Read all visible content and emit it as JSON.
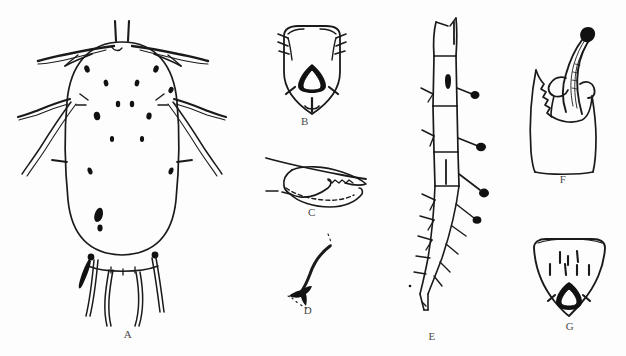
{
  "figure": {
    "background_color": "#fdfdfd",
    "ink_color": "#1a1a1a",
    "label_color": "#4a4a4a",
    "width": 626,
    "height": 356,
    "type": "scientific-taxonomic-line-plate"
  },
  "panels": [
    {
      "id": "A",
      "label": "A",
      "name": "whole-body-dorsal-habitus",
      "description": "Dorsal habitus of apterous aphid with oval body, paired head setae, long lateral marginal setae, dark dorsal sclerites and four long caudal setae",
      "label_x": 118,
      "label_y": 336
    },
    {
      "id": "B",
      "label": "B",
      "name": "anal-plate-and-genital-plate",
      "description": "Posterior abdominal plate bearing marginal setae and a dark median sclerite enclosing a pale teardrop",
      "label_x": 305,
      "label_y": 118
    },
    {
      "id": "C",
      "label": "C",
      "name": "mandible-stylet-structure",
      "description": "Angular mouthpart sclerite with serrate margin and dashed outline",
      "label_x": 311,
      "label_y": 215
    },
    {
      "id": "D",
      "label": "D",
      "name": "dorsal-seta-with-basal-socket",
      "description": "Single sinuate seta arising from a flared basal socket, dotted body outline",
      "label_x": 308,
      "label_y": 310
    },
    {
      "id": "E",
      "label": "E",
      "name": "antenna-segmented",
      "description": "Multi-segmented antenna with clavate setae on segments III to V and a slender terminal process",
      "label_x": 423,
      "label_y": 328
    },
    {
      "id": "F",
      "label": "F",
      "name": "siphunculus-lateral",
      "description": "Lateral view of siphunculus and surrounding integument with serrate edge",
      "label_x": 563,
      "label_y": 182
    },
    {
      "id": "G",
      "label": "G",
      "name": "anal-plate-triangular",
      "description": "Triangular anal plate with seven erect setae and a dark median sclerite with pale triangular lumen",
      "label_x": 565,
      "label_y": 328
    }
  ]
}
